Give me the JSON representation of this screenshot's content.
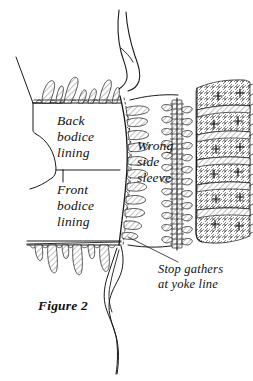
{
  "figure": {
    "caption": "Figure 2",
    "background_color": "#ffffff",
    "ink_color": "#1a1a1a",
    "medium": "pen-and-ink line drawing"
  },
  "labels": {
    "back_bodice_lining": "Back\nbodice\nlining",
    "front_bodice_lining": "Front\nbodice\nlining",
    "wrong_side_sleeve": "Wrong\nside\nsleeve",
    "stop_gathers": "Stop gathers\nat yoke line"
  },
  "parts": [
    {
      "name": "back-bodice-lining-panel",
      "label": "Back bodice lining"
    },
    {
      "name": "front-bodice-lining-panel",
      "label": "Front bodice lining"
    },
    {
      "name": "sleeve-panel",
      "label": "Wrong side sleeve"
    },
    {
      "name": "yoke-line-marker",
      "label": "Stop gathers at yoke line"
    }
  ],
  "annotations": {
    "leader_line": "leader line from 'Stop gathers at yoke line' to the yoke point on the armhole seam"
  }
}
